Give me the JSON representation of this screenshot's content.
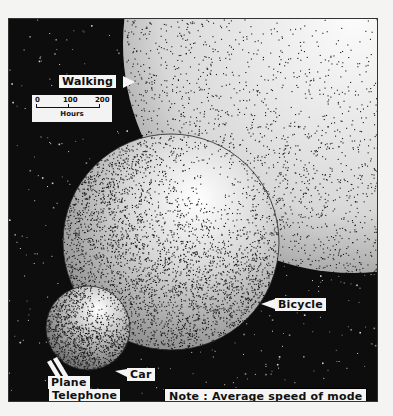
{
  "diagram": {
    "type": "proportional-circles",
    "note": "Note : Average speed of mode",
    "scale": {
      "ticks": [
        "0",
        "100",
        "200"
      ],
      "unit": "Hours"
    },
    "modes": [
      {
        "name": "Walking",
        "relative_size": "largest"
      },
      {
        "name": "Bicycle",
        "relative_size": "large"
      },
      {
        "name": "Car",
        "relative_size": "small"
      },
      {
        "name": "Plane",
        "relative_size": "tiny"
      },
      {
        "name": "Telephone",
        "relative_size": "tiny"
      }
    ]
  },
  "colors": {
    "background": "#0d0d0d",
    "circle_fill": "#f2f2f2",
    "stipple": "#1a1a1a",
    "label_bg": "#f5f5f5"
  }
}
